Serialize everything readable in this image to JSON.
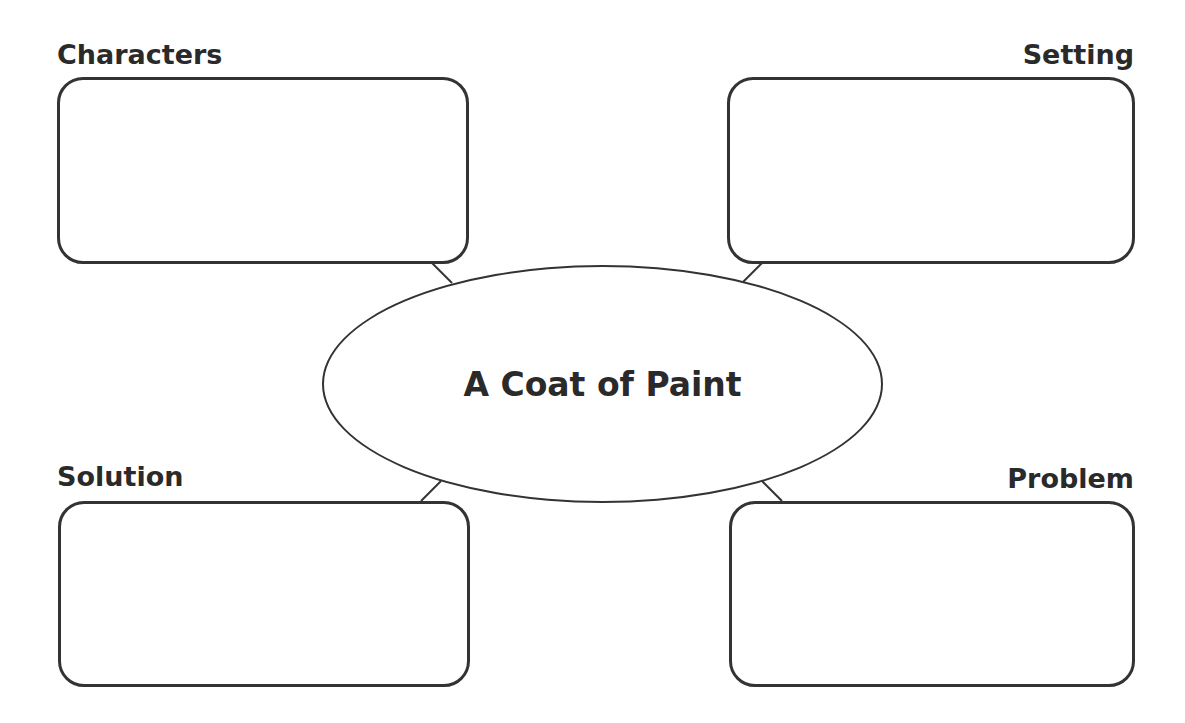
{
  "diagram": {
    "type": "story-map graphic organizer",
    "center": {
      "title": "A Coat of Paint"
    },
    "boxes": [
      {
        "id": "characters",
        "label": "Characters",
        "content": ""
      },
      {
        "id": "setting",
        "label": "Setting",
        "content": ""
      },
      {
        "id": "solution",
        "label": "Solution",
        "content": ""
      },
      {
        "id": "problem",
        "label": "Problem",
        "content": ""
      }
    ],
    "colors": {
      "stroke": "#333333",
      "text": "#2a2a2a",
      "background": "#ffffff"
    }
  }
}
